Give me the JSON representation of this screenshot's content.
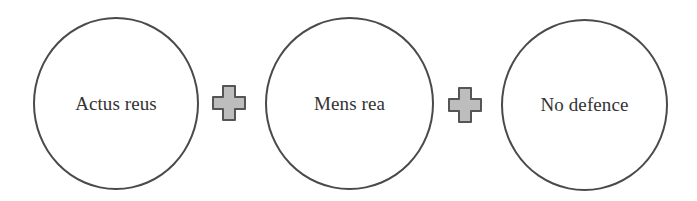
{
  "diagram": {
    "elements": [
      {
        "type": "circle",
        "label": "Actus reus"
      },
      {
        "type": "operator",
        "symbol": "plus",
        "icon": "plus-icon"
      },
      {
        "type": "circle",
        "label": "Mens rea"
      },
      {
        "type": "operator",
        "symbol": "plus",
        "icon": "plus-icon"
      },
      {
        "type": "circle",
        "label": "No defence"
      }
    ],
    "colors": {
      "circle_stroke": "#4a4a4a",
      "plus_fill": "#bdbdbd",
      "plus_stroke": "#555555",
      "text": "#333333"
    }
  }
}
